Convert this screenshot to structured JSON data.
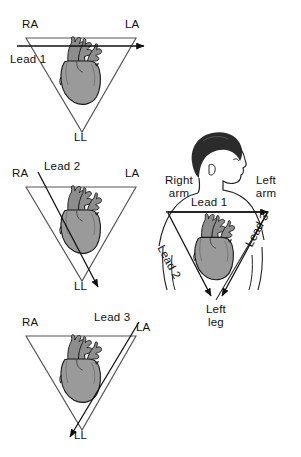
{
  "diagram": {
    "colors": {
      "background": "#ffffff",
      "ink": "#111111",
      "triangle_line": "#444444",
      "heart_fill": "#9a9a9a",
      "heart_vessels": "#6f6f6f",
      "heart_outline": "#1a1a1a",
      "hair": "#2b2b2b",
      "skin_outline": "#222222"
    },
    "panels": [
      {
        "id": "lead1-triangle",
        "name": "Lead 1 triangle",
        "vertices": {
          "top_left": "RA",
          "top_right": "LA",
          "bottom": "LL"
        },
        "lead_label": "Lead 1",
        "arrow": {
          "from": "RA",
          "to": "LA",
          "direction": "left-to-right horizontal"
        }
      },
      {
        "id": "lead2-triangle",
        "name": "Lead 2 triangle",
        "vertices": {
          "top_left": "RA",
          "top_right": "LA",
          "bottom": "LL"
        },
        "lead_label": "Lead 2",
        "arrow": {
          "from": "RA",
          "to": "LL",
          "direction": "upper-left to lower-right"
        }
      },
      {
        "id": "lead3-triangle",
        "name": "Lead 3 triangle",
        "vertices": {
          "top_left": "RA",
          "top_right": "LA",
          "bottom": "LL"
        },
        "lead_label": "Lead 3",
        "arrow": {
          "from": "LA",
          "to": "LL",
          "direction": "upper-right to lower-left"
        }
      }
    ],
    "body_panel": {
      "id": "body-triangle",
      "name": "Torso with Einthoven triangle",
      "labels": {
        "right_arm_line1": "Right",
        "right_arm_line2": "arm",
        "left_arm_line1": "Left",
        "left_arm_line2": "arm",
        "lead1": "Lead 1",
        "lead2": "Lead 2",
        "lead3": "Lead 3",
        "left_leg_line1": "Left",
        "left_leg_line2": "leg"
      },
      "arrows": [
        {
          "name": "lead-1-arrow",
          "from": "Right arm",
          "to": "Left arm"
        },
        {
          "name": "lead-2-arrow",
          "from": "Right arm",
          "to": "Left leg"
        },
        {
          "name": "lead-3-arrow",
          "from": "Left arm",
          "to": "Left leg"
        }
      ]
    },
    "vertex_labels": {
      "ra": "RA",
      "la": "LA",
      "ll": "LL"
    }
  }
}
